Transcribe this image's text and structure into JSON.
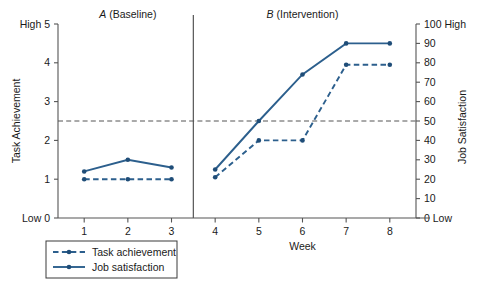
{
  "chart_data": {
    "type": "line",
    "title": "",
    "xlabel": "Week",
    "x": [
      1,
      2,
      3,
      4,
      5,
      6,
      7,
      8
    ],
    "xtick_labels": [
      "1",
      "2",
      "3",
      "4",
      "5",
      "6",
      "7",
      "8"
    ],
    "xlim": [
      0.4,
      8.6
    ],
    "grid": false,
    "legend_position": "below-left",
    "axes": {
      "left": {
        "label": "Task Achievement",
        "ylim": [
          0,
          5
        ],
        "ticks": [
          0,
          1,
          2,
          3,
          4,
          5
        ],
        "tick_labels": [
          "0",
          "1",
          "2",
          "3",
          "4",
          "5"
        ],
        "low_cap": "Low",
        "high_cap": "High"
      },
      "right": {
        "label": "Job Satisfaction",
        "ylim": [
          0,
          100
        ],
        "ticks": [
          0,
          10,
          20,
          30,
          40,
          50,
          60,
          70,
          80,
          90,
          100
        ],
        "tick_labels": [
          "0",
          "10",
          "20",
          "30",
          "40",
          "50",
          "60",
          "70",
          "80",
          "90",
          "100"
        ],
        "low_cap": "Low",
        "high_cap": "High"
      }
    },
    "phases": [
      {
        "letter": "A",
        "name": "(Baseline)",
        "weeks": [
          1,
          2,
          3
        ]
      },
      {
        "letter": "B",
        "name": "(Intervention)",
        "weeks": [
          4,
          5,
          6,
          7,
          8
        ]
      }
    ],
    "phase_divider_x": 3.5,
    "reference_line": {
      "left_value": 2.5,
      "right_value": 50,
      "style": "dashed"
    },
    "series": [
      {
        "name": "Task achievement",
        "axis": "left",
        "style": "dashed",
        "color": "#2c5f8d",
        "segments": [
          {
            "phase": "A",
            "x": [
              1,
              2,
              3
            ],
            "values": [
              1.0,
              1.0,
              1.0
            ]
          },
          {
            "phase": "B",
            "x": [
              4,
              5,
              6,
              7,
              8
            ],
            "values": [
              1.05,
              2.0,
              2.0,
              3.95,
              3.95
            ]
          }
        ]
      },
      {
        "name": "Job satisfaction",
        "axis": "right",
        "style": "solid",
        "color": "#2c5f8d",
        "segments": [
          {
            "phase": "A",
            "x": [
              1,
              2,
              3
            ],
            "values": [
              24,
              30,
              26
            ]
          },
          {
            "phase": "B",
            "x": [
              4,
              5,
              6,
              7,
              8
            ],
            "values": [
              25,
              50,
              74,
              90,
              90
            ]
          }
        ]
      }
    ]
  },
  "legend": {
    "items": [
      {
        "label": "Task achievement",
        "style": "dashed"
      },
      {
        "label": "Job satisfaction",
        "style": "solid"
      }
    ]
  },
  "labels": {
    "left_high": "High 5",
    "left_low": "Low 0",
    "right_high": "100 High",
    "right_low": "0 Low",
    "left_title": "Task Achievement",
    "right_title": "Job Satisfaction",
    "x_title": "Week",
    "phase_a": "A (Baseline)",
    "phase_b": "B (Intervention)"
  },
  "colors": {
    "series": "#2c5f8d",
    "marker": "#1f4d78",
    "axis": "#555555",
    "text": "#1a1a1a",
    "background": "#ffffff"
  }
}
